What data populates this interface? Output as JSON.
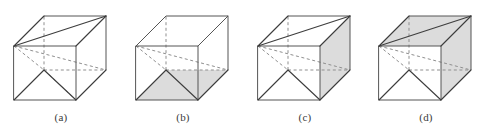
{
  "figure": {
    "type": "line-diagram",
    "background_color": "#ffffff",
    "stroke_color_visible": "#555555",
    "stroke_color_hidden": "#8f8f8f",
    "shade_color": "#dcdcdc",
    "panels": [
      {
        "id": "a",
        "label": "(a)",
        "shaded_faces": [],
        "shaded_count": 0
      },
      {
        "id": "b",
        "label": "(b)",
        "shaded_faces": [
          "bottom"
        ],
        "shaded_count": 1
      },
      {
        "id": "c",
        "label": "(c)",
        "shaded_faces": [
          "right"
        ],
        "shaded_count": 1
      },
      {
        "id": "d",
        "label": "(d)",
        "shaded_faces": [
          "top",
          "right"
        ],
        "shaded_count": 2
      }
    ]
  },
  "geometry": {
    "front_face": {
      "top_left": [
        14,
        46
      ],
      "top_right": [
        76,
        46
      ],
      "bottom_right": [
        76,
        100
      ],
      "bottom_left": [
        14,
        100
      ]
    },
    "back_face": {
      "top_left": [
        44,
        16
      ],
      "top_right": [
        106,
        16
      ],
      "bottom_right": [
        106,
        70
      ],
      "bottom_left": [
        44,
        70
      ]
    },
    "projection_offset": [
      30,
      -30
    ]
  }
}
